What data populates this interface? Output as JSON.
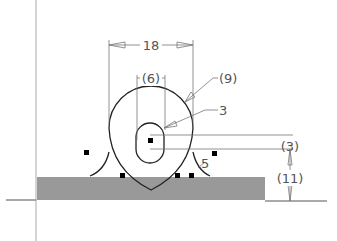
{
  "drawing": {
    "type": "cad-sketch",
    "dimensions": {
      "overall_width": "18",
      "slot_width": "(6)",
      "outer_radius": "(9)",
      "slot_radius": "3",
      "fillet_radius": "5",
      "slot_length": "(3)",
      "height_above_base": "(11)"
    },
    "colors": {
      "base_fill": "#999999",
      "line": "#222222",
      "dim_line": "#777777",
      "axis": "#aaaaaa",
      "point": "#000000"
    }
  }
}
